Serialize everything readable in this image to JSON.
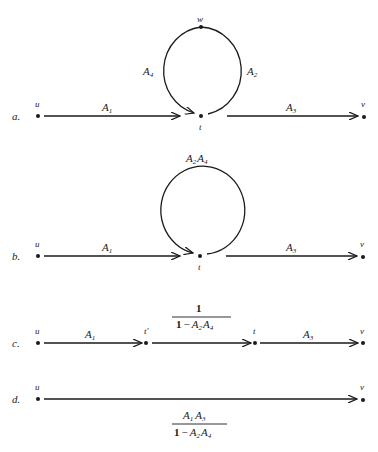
{
  "panels": [
    {
      "id": "a",
      "label": "a.",
      "nodes": {
        "u": "u",
        "t": "t",
        "w": "w",
        "v": "v"
      },
      "edges": [
        {
          "from": "u",
          "to": "t",
          "label": "A",
          "sub": "1"
        },
        {
          "from": "t",
          "to": "w",
          "label": "A",
          "sub": "2"
        },
        {
          "from": "t",
          "to": "v",
          "label": "A",
          "sub": "3"
        },
        {
          "from": "w",
          "to": "t",
          "label": "A",
          "sub": "4"
        }
      ]
    },
    {
      "id": "b",
      "label": "b.",
      "nodes": {
        "u": "u",
        "t": "t",
        "v": "v"
      },
      "edges": [
        {
          "from": "u",
          "to": "t",
          "label": "A",
          "sub": "1"
        },
        {
          "from": "t",
          "to": "t",
          "label_parts": [
            {
              "label": "A",
              "sub": "2"
            },
            {
              "label": "A",
              "sub": "4"
            }
          ]
        },
        {
          "from": "t",
          "to": "v",
          "label": "A",
          "sub": "3"
        }
      ]
    },
    {
      "id": "c",
      "label": "c.",
      "nodes": {
        "u": "u",
        "t_prime": "t′",
        "t": "t",
        "v": "v"
      },
      "edges": [
        {
          "from": "u",
          "to": "t_prime",
          "label": "A",
          "sub": "1"
        },
        {
          "from": "t_prime",
          "to": "t",
          "fraction": {
            "numerator": "1",
            "denominator": "1 − A₂A₄"
          }
        },
        {
          "from": "t",
          "to": "v",
          "label": "A",
          "sub": "3"
        }
      ]
    },
    {
      "id": "d",
      "label": "d.",
      "nodes": {
        "u": "u",
        "v": "v"
      },
      "edges": [
        {
          "from": "u",
          "to": "v",
          "fraction": {
            "numerator": "A₁A₃",
            "denominator": "1 − A₂A₄"
          }
        }
      ]
    }
  ],
  "text": {
    "a_label": "a.",
    "b_label": "b.",
    "c_label": "c.",
    "d_label": "d.",
    "u": "u",
    "t": "t",
    "w": "w",
    "v": "v",
    "t_prime": "t′",
    "A": "A",
    "s1": "1",
    "s2": "2",
    "s3": "3",
    "s4": "4",
    "frac_c_num": "1",
    "frac_c_den_1": "1",
    "frac_c_den_minus": "−",
    "frac_d_den_1": "1",
    "frac_d_den_minus": "−"
  }
}
